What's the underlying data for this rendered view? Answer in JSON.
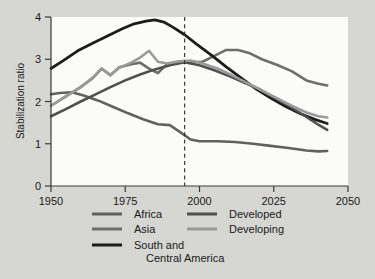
{
  "chart_data": {
    "type": "line",
    "title": "",
    "xlabel": "",
    "ylabel": "Stabilization ratio",
    "xlim": [
      1950,
      2050
    ],
    "ylim": [
      0,
      4
    ],
    "xticks": [
      1950,
      1975,
      2000,
      2025,
      2050
    ],
    "yticks": [
      0,
      1,
      2,
      3,
      4
    ],
    "grid": false,
    "legend_position": "below",
    "annotations": [
      {
        "type": "vline",
        "x": 1995,
        "style": "dashed",
        "label": ""
      }
    ],
    "series": [
      {
        "name": "Africa",
        "color": "#616161",
        "width": 2.6,
        "x": [
          1950,
          1953,
          1957,
          1961,
          1966,
          1971,
          1976,
          1981,
          1986,
          1990,
          1993,
          1997,
          2000,
          2006,
          2012,
          2018,
          2024,
          2030,
          2036,
          2040,
          2043
        ],
        "y": [
          2.17,
          2.2,
          2.22,
          2.14,
          2.02,
          1.87,
          1.72,
          1.58,
          1.46,
          1.44,
          1.3,
          1.1,
          1.06,
          1.06,
          1.04,
          1.0,
          0.95,
          0.9,
          0.84,
          0.82,
          0.83
        ]
      },
      {
        "name": "Asia",
        "color": "#6e6e6e",
        "width": 2.6,
        "x": [
          1950,
          1955,
          1960,
          1964,
          1967,
          1970,
          1973,
          1977,
          1980,
          1983,
          1986,
          1989,
          1993,
          1997,
          2001,
          2005,
          2009,
          2013,
          2017,
          2021,
          2026,
          2031,
          2036,
          2040,
          2043
        ],
        "y": [
          1.9,
          2.12,
          2.34,
          2.55,
          2.78,
          2.62,
          2.81,
          2.88,
          2.92,
          2.78,
          2.67,
          2.88,
          2.92,
          2.93,
          2.94,
          3.08,
          3.22,
          3.22,
          3.14,
          3.0,
          2.87,
          2.72,
          2.5,
          2.42,
          2.38
        ]
      },
      {
        "name": "South and Central America",
        "color": "#1c1c1c",
        "width": 2.8,
        "x": [
          1950,
          1954,
          1959,
          1964,
          1969,
          1974,
          1978,
          1982,
          1985,
          1988,
          1991,
          1995,
          1999,
          2004,
          2009,
          2014,
          2019,
          2024,
          2029,
          2034,
          2039,
          2043
        ],
        "y": [
          2.78,
          2.96,
          3.2,
          3.38,
          3.55,
          3.72,
          3.84,
          3.9,
          3.93,
          3.88,
          3.76,
          3.58,
          3.36,
          3.1,
          2.82,
          2.56,
          2.3,
          2.08,
          1.88,
          1.71,
          1.57,
          1.48
        ]
      },
      {
        "name": "Developed",
        "color": "#4f4f4f",
        "width": 2.6,
        "x": [
          1950,
          1955,
          1960,
          1965,
          1970,
          1975,
          1980,
          1985,
          1990,
          1995,
          2000,
          2005,
          2010,
          2015,
          2020,
          2025,
          2030,
          2035,
          2040,
          2043
        ],
        "y": [
          1.65,
          1.82,
          2.0,
          2.17,
          2.34,
          2.5,
          2.64,
          2.76,
          2.86,
          2.93,
          2.86,
          2.74,
          2.6,
          2.45,
          2.3,
          2.1,
          1.9,
          1.68,
          1.45,
          1.33
        ]
      },
      {
        "name": "Developing",
        "color": "#9a9a9a",
        "width": 2.6,
        "x": [
          1950,
          1955,
          1960,
          1964,
          1967,
          1970,
          1973,
          1977,
          1980,
          1983,
          1986,
          1989,
          1993,
          1997,
          2001,
          2006,
          2011,
          2016,
          2021,
          2026,
          2031,
          2036,
          2040,
          2043
        ],
        "y": [
          1.9,
          2.12,
          2.34,
          2.56,
          2.78,
          2.63,
          2.8,
          2.92,
          3.04,
          3.2,
          2.94,
          2.9,
          2.95,
          2.97,
          2.9,
          2.78,
          2.62,
          2.44,
          2.26,
          2.08,
          1.9,
          1.74,
          1.65,
          1.62
        ]
      }
    ]
  },
  "axis": {
    "ylabel": "Stabilization ratio",
    "xtick_labels": [
      "1950",
      "1975",
      "2000",
      "2025",
      "2050"
    ],
    "ytick_labels": [
      "0",
      "1",
      "2",
      "3",
      "4"
    ]
  },
  "legend": {
    "entries": [
      {
        "label": "Africa",
        "color": "#616161",
        "column": 0,
        "row": 0
      },
      {
        "label": "Asia",
        "color": "#6e6e6e",
        "column": 0,
        "row": 1
      },
      {
        "label": "South and",
        "color": "#1c1c1c",
        "column": 0,
        "row": 2
      },
      {
        "label": "Central America",
        "color": "",
        "column": 0,
        "row": 3
      },
      {
        "label": "Developed",
        "color": "#4f4f4f",
        "column": 1,
        "row": 0
      },
      {
        "label": "Developing",
        "color": "#9a9a9a",
        "column": 1,
        "row": 1
      }
    ]
  },
  "colors": {
    "page_background": "#d6d6d2",
    "plot_background": "#fbfbfa",
    "axis": "#3a3a3a",
    "text": "#1a1a1a"
  }
}
